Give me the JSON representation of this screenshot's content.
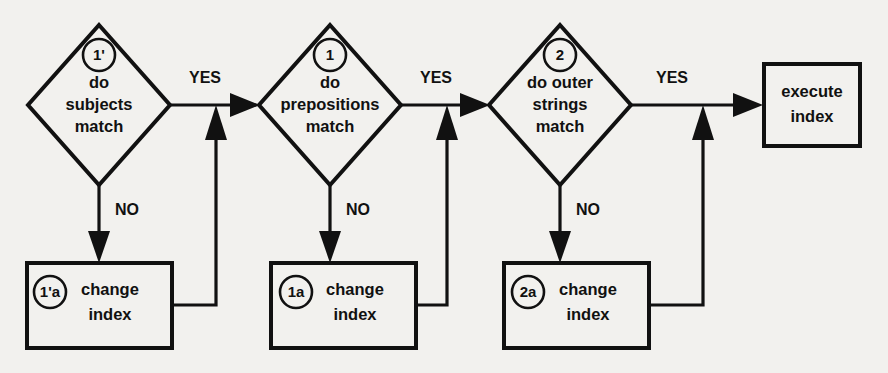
{
  "diagram": {
    "background_color": "#f2f1ee",
    "line_color": "#111111",
    "decisions": [
      {
        "id": "decision-subjects",
        "badge": "1'",
        "line1": "do",
        "line2": "subjects",
        "line3": "match",
        "yes_label": "YES",
        "no_label": "NO"
      },
      {
        "id": "decision-prepositions",
        "badge": "1",
        "line1": "do",
        "line2": "prepositions",
        "line3": "match",
        "yes_label": "YES",
        "no_label": "NO"
      },
      {
        "id": "decision-outer-strings",
        "badge": "2",
        "line1": "do outer",
        "line2": "strings",
        "line3": "match",
        "yes_label": "YES",
        "no_label": "NO"
      }
    ],
    "processes": [
      {
        "id": "process-change-index-1p",
        "badge": "1'a",
        "line1": "change",
        "line2": "index"
      },
      {
        "id": "process-change-index-1",
        "badge": "1a",
        "line1": "change",
        "line2": "index"
      },
      {
        "id": "process-change-index-2",
        "badge": "2a",
        "line1": "change",
        "line2": "index"
      }
    ],
    "terminal": {
      "id": "process-execute-index",
      "line1": "execute",
      "line2": "index"
    }
  }
}
